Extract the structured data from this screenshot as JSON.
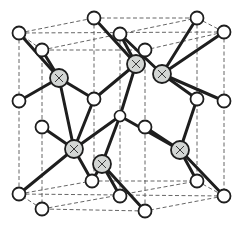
{
  "diagram": {
    "title": "",
    "type": "crystal-lattice",
    "colors": {
      "background": "#ffffff",
      "bond": "#1e1e1e",
      "cell_edge": "#555555",
      "atom_white_fill": "#ffffff",
      "atom_gray_fill": "#d3d6d4"
    },
    "white_atoms": [
      {
        "id": "w1",
        "x": 19,
        "y": 33
      },
      {
        "id": "w2",
        "x": 42,
        "y": 50
      },
      {
        "id": "w3",
        "x": 94,
        "y": 18
      },
      {
        "id": "w4",
        "x": 120,
        "y": 34
      },
      {
        "id": "w5",
        "x": 145,
        "y": 50
      },
      {
        "id": "w6",
        "x": 197,
        "y": 18
      },
      {
        "id": "w7",
        "x": 224,
        "y": 32
      },
      {
        "id": "w8",
        "x": 19,
        "y": 101
      },
      {
        "id": "w9",
        "x": 42,
        "y": 127
      },
      {
        "id": "w10",
        "x": 94,
        "y": 99
      },
      {
        "id": "w11",
        "x": 145,
        "y": 127
      },
      {
        "id": "w12",
        "x": 197,
        "y": 99
      },
      {
        "id": "w13",
        "x": 224,
        "y": 101
      },
      {
        "id": "w14",
        "x": 19,
        "y": 194
      },
      {
        "id": "w15",
        "x": 42,
        "y": 209
      },
      {
        "id": "w16",
        "x": 92,
        "y": 181
      },
      {
        "id": "w17",
        "x": 120,
        "y": 196
      },
      {
        "id": "w18",
        "x": 145,
        "y": 211
      },
      {
        "id": "w19",
        "x": 197,
        "y": 181
      },
      {
        "id": "w20",
        "x": 224,
        "y": 196
      }
    ],
    "center_atom": {
      "id": "c1",
      "x": 120,
      "y": 116
    },
    "gray_atoms": [
      {
        "id": "g1",
        "x": 59,
        "y": 78
      },
      {
        "id": "g2",
        "x": 136,
        "y": 64
      },
      {
        "id": "g3",
        "x": 162,
        "y": 74
      },
      {
        "id": "g4",
        "x": 74,
        "y": 149
      },
      {
        "id": "g5",
        "x": 102,
        "y": 164
      },
      {
        "id": "g6",
        "x": 180,
        "y": 150
      }
    ],
    "bonds": [
      [
        "g1",
        "w1"
      ],
      [
        "g1",
        "w2"
      ],
      [
        "g1",
        "w8"
      ],
      [
        "g1",
        "w10"
      ],
      [
        "g2",
        "w3"
      ],
      [
        "g2",
        "w4"
      ],
      [
        "g2",
        "w10"
      ],
      [
        "g2",
        "c1"
      ],
      [
        "g3",
        "w4"
      ],
      [
        "g3",
        "w6"
      ],
      [
        "g3",
        "w7"
      ],
      [
        "g3",
        "w12"
      ],
      [
        "g4",
        "w9"
      ],
      [
        "g4",
        "w14"
      ],
      [
        "g4",
        "w10"
      ],
      [
        "g4",
        "c1"
      ],
      [
        "g5",
        "w16"
      ],
      [
        "g5",
        "w17"
      ],
      [
        "g5",
        "w18"
      ],
      [
        "g5",
        "c1"
      ],
      [
        "g6",
        "w11"
      ],
      [
        "g6",
        "w12"
      ],
      [
        "g6",
        "w19"
      ],
      [
        "g6",
        "w20"
      ],
      [
        "g3",
        "w13"
      ],
      [
        "g6",
        "c1"
      ],
      [
        "g4",
        "w16"
      ],
      [
        "g1",
        "g4"
      ]
    ]
  }
}
